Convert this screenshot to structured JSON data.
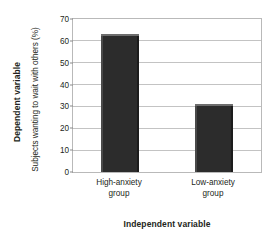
{
  "chart_data": {
    "type": "bar",
    "title": "",
    "categories": [
      "High-anxiety group",
      "Low-anxiety group"
    ],
    "category_lines": [
      [
        "High-anxiety",
        "group"
      ],
      [
        "Low-anxiety",
        "group"
      ]
    ],
    "values": [
      63,
      31
    ],
    "xlabel": "Independent variable",
    "ylabel": "Subjects wanting to wait with others (%)",
    "y_outer_label": "Dependent variable",
    "ylim": [
      0,
      70
    ],
    "ytick_values": [
      0,
      10,
      20,
      30,
      40,
      50,
      60,
      70
    ],
    "ytick_labels": [
      "0",
      "10",
      "20",
      "30",
      "40",
      "50",
      "60",
      "70"
    ],
    "grid": true,
    "legend": "none",
    "bar_color": "#2c2c2c",
    "grid_color": "#c3c3c3",
    "frame_color": "#b9b9b9",
    "text_color": "#231f20"
  }
}
